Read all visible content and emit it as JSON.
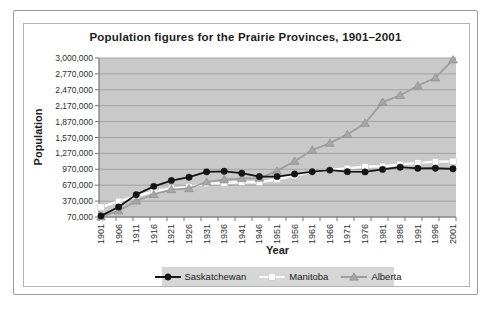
{
  "window": {
    "background": "#ffffff"
  },
  "chart_data": {
    "type": "line",
    "title": "Population figures for the Prairie Provinces, 1901–2001",
    "xlabel": "Year",
    "ylabel": "Population",
    "categories": [
      "1901",
      "1906",
      "1911",
      "1916",
      "1921",
      "1926",
      "1931",
      "1936",
      "1941",
      "1946",
      "1951",
      "1956",
      "1961",
      "1966",
      "1971",
      "1976",
      "1981",
      "1986",
      "1991",
      "1996",
      "2001"
    ],
    "y_ticks": [
      70000,
      370000,
      670000,
      970000,
      1270000,
      1570000,
      1870000,
      2170000,
      2470000,
      2770000,
      3000000
    ],
    "y_tick_labels": [
      "70,000",
      "370,000",
      "670,000",
      "970,000",
      "1,270,000",
      "1,570,000",
      "1,870,000",
      "2,170,000",
      "2,470,000",
      "2,770,000",
      "3,000,000"
    ],
    "ylim": [
      70000,
      3000000
    ],
    "grid": true,
    "legend_position": "bottom",
    "x_tick_rotation": -90,
    "series": [
      {
        "name": "Saskatchewan",
        "marker": "circle",
        "color": "#141414",
        "marker_fill": "#141414",
        "marker_stroke": "#141414",
        "values": [
          91000,
          258000,
          492000,
          648000,
          758000,
          821000,
          922000,
          932000,
          896000,
          833000,
          832000,
          881000,
          925000,
          955000,
          926000,
          921000,
          968000,
          1010000,
          989000,
          990000,
          979000
        ]
      },
      {
        "name": "Manitoba",
        "marker": "square",
        "color": "#fdfdfd",
        "marker_fill": "#ffffff",
        "marker_stroke": "#c2c2c2",
        "values": [
          255000,
          366000,
          461000,
          554000,
          610000,
          639000,
          700000,
          711000,
          730000,
          727000,
          777000,
          850000,
          922000,
          963000,
          988000,
          1022000,
          1026000,
          1063000,
          1092000,
          1114000,
          1120000
        ]
      },
      {
        "name": "Alberta",
        "marker": "triangle",
        "color": "#9e9e9e",
        "marker_fill": "#a6a6a6",
        "marker_stroke": "#8a8a8a",
        "values": [
          73000,
          185000,
          374000,
          497000,
          588000,
          608000,
          732000,
          773000,
          796000,
          803000,
          940000,
          1123000,
          1332000,
          1463000,
          1628000,
          1838000,
          2238000,
          2366000,
          2546000,
          2697000,
          2975000
        ]
      }
    ],
    "colors": {
      "plot_bg": "#c9c9c9",
      "gridline": "#a3a3a3",
      "axis": "#787878",
      "tick_text": "#2e2e2e",
      "legend_bg": "#d6d6d6"
    }
  }
}
